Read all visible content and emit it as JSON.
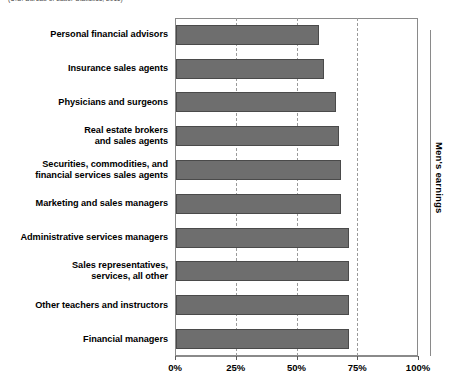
{
  "source_note": "(U.S. Bureau of Labor Statistics, 2011)",
  "right_axis_label": "Men's earnings",
  "chart_data": {
    "type": "bar",
    "orientation": "horizontal",
    "title": "",
    "xlabel": "",
    "ylabel": "",
    "xlim": [
      0,
      100
    ],
    "xticks": [
      "0%",
      "25%",
      "50%",
      "75%",
      "100%"
    ],
    "xtick_values": [
      0,
      25,
      50,
      75,
      100
    ],
    "grid": true,
    "gridlines_at": [
      25,
      50,
      75
    ],
    "legend": "none",
    "bar_color": "#6e6e6e",
    "bar_border_color": "#4a4a4a",
    "categories": [
      "Personal financial advisors",
      "Insurance sales agents",
      "Physicians and surgeons",
      "Real estate brokers\nand sales agents",
      "Securities, commodities, and\nfinancial services sales agents",
      "Marketing and sales managers",
      "Administrative services managers",
      "Sales representatives,\nservices, all other",
      "Other teachers and instructors",
      "Financial managers"
    ],
    "values": [
      59,
      61,
      66,
      67,
      68,
      68,
      71,
      71,
      71,
      71
    ]
  }
}
